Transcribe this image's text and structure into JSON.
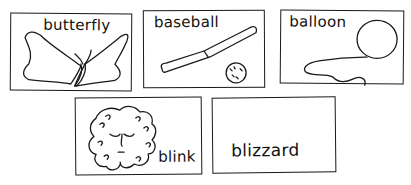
{
  "cards": [
    {
      "word": "butterfly",
      "picture": "butterfly"
    },
    {
      "word": "baseball",
      "picture": "baseball-bat-and-ball"
    },
    {
      "word": "balloon",
      "picture": "balloon-with-string"
    },
    {
      "word": "blink",
      "picture": "face-with-closed-eyes"
    },
    {
      "word": "blizzard",
      "picture": "none"
    }
  ],
  "colors": {
    "ink": "#1a1a1a",
    "paper": "#ffffff"
  }
}
